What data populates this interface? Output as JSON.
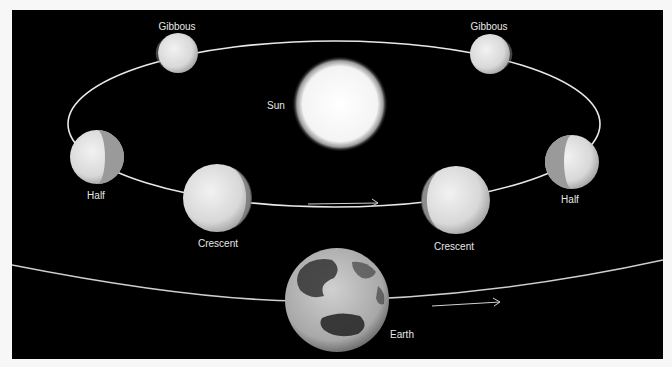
{
  "diagram": {
    "background": "#000000",
    "sun": {
      "label": "Sun",
      "cx": 340,
      "cy": 104,
      "r": 44
    },
    "orbit_inner": {
      "cx": 334,
      "cy": 124,
      "rx": 266,
      "ry": 83
    },
    "planets": [
      {
        "phase": "Gibbous",
        "label": "Gibbous",
        "cx": 178,
        "cy": 53,
        "r": 20
      },
      {
        "phase": "Gibbous",
        "label": "Gibbous",
        "cx": 490,
        "cy": 54,
        "r": 20
      },
      {
        "phase": "Half",
        "label": "Half",
        "cx": 97,
        "cy": 157,
        "r": 27
      },
      {
        "phase": "Half",
        "label": "Half",
        "cx": 572,
        "cy": 162,
        "r": 27
      },
      {
        "phase": "Crescent",
        "label": "Crescent",
        "cx": 217,
        "cy": 198,
        "r": 34
      },
      {
        "phase": "Crescent",
        "label": "Crescent",
        "cx": 456,
        "cy": 200,
        "r": 34
      }
    ],
    "earth": {
      "label": "Earth",
      "cx": 337,
      "cy": 300,
      "r": 52
    },
    "labels": {
      "sun": "Sun",
      "gibbous_left": "Gibbous",
      "gibbous_right": "Gibbous",
      "half_left": "Half",
      "half_right": "Half",
      "crescent_left": "Crescent",
      "crescent_right": "Crescent",
      "earth": "Earth"
    },
    "arrows": [
      {
        "name": "venus-orbit-direction",
        "x1": 308,
        "y1": 204,
        "x2": 378,
        "y2": 203
      },
      {
        "name": "earth-orbit-direction",
        "x1": 432,
        "y1": 306,
        "x2": 500,
        "y2": 302
      }
    ]
  }
}
